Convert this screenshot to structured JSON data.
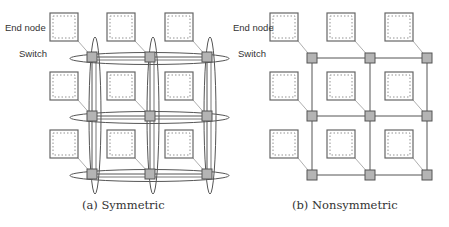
{
  "figure": {
    "labels": {
      "end_node": "End node",
      "switch": "Switch"
    },
    "panels": [
      {
        "id": "symmetric",
        "caption": "(a) Symmetric",
        "topology": "2D torus (3x3) with wraparound links",
        "switches_x": [
          92,
          150,
          207
        ],
        "switches_y": [
          57,
          116,
          174
        ],
        "nodes_x": [
          50,
          107,
          165
        ],
        "nodes_y": [
          13,
          72,
          130
        ]
      },
      {
        "id": "nonsymmetric",
        "caption": "(b) Nonsymmetric",
        "topology": "2D mesh (3x3)",
        "switches_x": [
          312,
          370,
          427
        ],
        "switches_y": [
          58,
          116,
          175
        ],
        "nodes_x": [
          270,
          327,
          385
        ],
        "nodes_y": [
          13,
          72,
          130
        ]
      }
    ],
    "colors": {
      "switch_fill": "#b4b4b4",
      "line": "#555555",
      "node_border": "#666666"
    }
  }
}
